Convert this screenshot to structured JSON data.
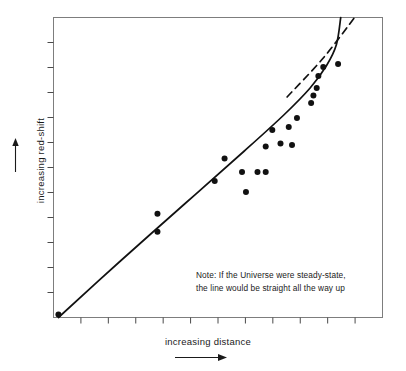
{
  "figure": {
    "kind": "scientific-line-plot",
    "background_color": "#ffffff",
    "ink_color": "#111111",
    "frame_color": "#7a7a7a"
  },
  "axes": {
    "y": {
      "label": "increasing red-shift",
      "arrow": "up-arrow-icon",
      "tick_count": 11,
      "ticks_outward": true,
      "tick_labels": []
    },
    "x": {
      "label": "increasing distance",
      "arrow": "right-arrow-icon",
      "tick_count": 11,
      "ticks_outward": true,
      "tick_labels": []
    }
  },
  "annotation": {
    "line1": "Note: If the Universe were steady-state,",
    "line2": "the line would be straight all the way up"
  },
  "chart_data": {
    "type": "scatter",
    "title": "",
    "xlabel": "increasing distance",
    "ylabel": "increasing red-shift",
    "xlim": [
      0,
      100
    ],
    "ylim": [
      0,
      100
    ],
    "grid": false,
    "legend": null,
    "axis_ticks_labeled": false,
    "note": "Note: If the Universe were steady-state, the line would be straight all the way up",
    "series": [
      {
        "name": "observed galaxies",
        "type": "scatter",
        "marker": "filled-circle",
        "color": "#111111",
        "points": [
          [
            1.5,
            1.0
          ],
          [
            31.6,
            28.6
          ],
          [
            31.6,
            34.6
          ],
          [
            49.0,
            45.5
          ],
          [
            52.0,
            53.0
          ],
          [
            57.3,
            48.5
          ],
          [
            58.5,
            41.8
          ],
          [
            62.0,
            48.5
          ],
          [
            64.5,
            48.5
          ],
          [
            64.5,
            57.0
          ],
          [
            66.5,
            62.5
          ],
          [
            69.0,
            58.0
          ],
          [
            71.5,
            63.5
          ],
          [
            72.5,
            57.5
          ],
          [
            74.0,
            66.5
          ],
          [
            78.3,
            71.5
          ],
          [
            79.0,
            74.0
          ],
          [
            80.0,
            76.5
          ],
          [
            80.5,
            80.5
          ],
          [
            82.0,
            83.5
          ],
          [
            86.5,
            84.5
          ]
        ]
      },
      {
        "name": "observed relation (curving up)",
        "type": "line",
        "style": "solid",
        "color": "#111111",
        "width": 1.7,
        "points": [
          [
            1.5,
            0.0
          ],
          [
            20.0,
            18.5
          ],
          [
            40.0,
            38.0
          ],
          [
            58.0,
            55.5
          ],
          [
            70.0,
            67.5
          ],
          [
            78.0,
            76.5
          ],
          [
            83.0,
            84.0
          ],
          [
            86.0,
            91.0
          ],
          [
            87.3,
            100.0
          ]
        ]
      },
      {
        "name": "steady-state extrapolation",
        "type": "line",
        "style": "dashed",
        "color": "#111111",
        "width": 1.7,
        "dash": "7,5",
        "points": [
          [
            71.0,
            73.5
          ],
          [
            82.0,
            86.5
          ],
          [
            91.5,
            100.0
          ]
        ]
      }
    ]
  }
}
